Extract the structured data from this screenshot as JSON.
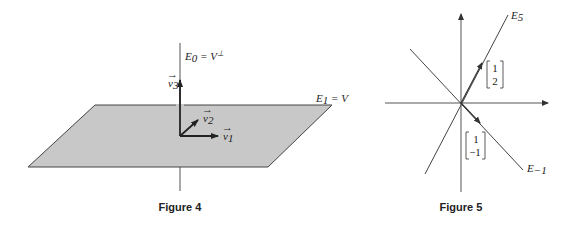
{
  "figure4": {
    "caption": "Figure 4",
    "labels": {
      "e0": "E",
      "e0_sub": "0",
      "e0_rest": " = V",
      "e0_sup": "⊥",
      "e1": "E",
      "e1_sub": "1",
      "e1_rest": " = V",
      "v1": "v",
      "v1_sub": "1",
      "v2": "v",
      "v2_sub": "2",
      "v3": "v",
      "v3_sub": "3"
    },
    "plane_color": "#c8c8c8"
  },
  "figure5": {
    "caption": "Figure 5",
    "labels": {
      "e5": "E",
      "e5_sub": "5",
      "em1": "E",
      "em1_sub": "−1"
    },
    "vector_a": [
      "1",
      "2"
    ],
    "vector_b": [
      "1",
      "−1"
    ]
  }
}
